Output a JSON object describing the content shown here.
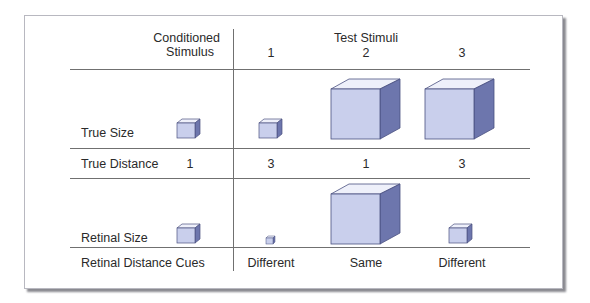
{
  "header": {
    "conditioned_line1": "Conditioned",
    "conditioned_line2": "Stimulus",
    "test_title": "Test Stimuli",
    "test_cols": [
      "1",
      "2",
      "3"
    ]
  },
  "rows": {
    "true_size": {
      "label": "True Size"
    },
    "true_distance": {
      "label": "True Distance",
      "values": [
        "1",
        "3",
        "1",
        "3"
      ]
    },
    "retinal_size": {
      "label": "Retinal Size"
    },
    "retinal_distance_cues": {
      "label": "Retinal Distance Cues",
      "values": [
        "Different",
        "Same",
        "Different"
      ]
    }
  },
  "colors": {
    "cube_front": "#c9cfec",
    "cube_top": "#eef0fa",
    "cube_side": "#6d76ad",
    "cube_edge": "#4a5080",
    "rule": "#707070"
  }
}
